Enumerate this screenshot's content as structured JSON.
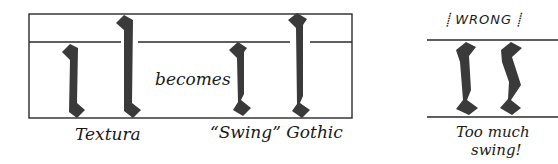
{
  "diagram": {
    "labels": {
      "textura": "Textura",
      "becomes": "becomes",
      "swing_gothic": "“Swing” Gothic",
      "wrong": "⸽ WRONG ⸽",
      "too_much_line1": "Too much",
      "too_much_line2": "swing!"
    },
    "colors": {
      "stroke_fill": "#3a3a3a",
      "guide_lines": "#2a2a2a",
      "background": "#ffffff"
    },
    "panels": [
      {
        "name": "textura",
        "strokes": [
          "minim",
          "ascender"
        ]
      },
      {
        "name": "swing-gothic",
        "strokes": [
          "minim",
          "ascender"
        ]
      },
      {
        "name": "wrong-too-much-swing",
        "strokes": [
          "minim",
          "minim"
        ]
      }
    ]
  }
}
